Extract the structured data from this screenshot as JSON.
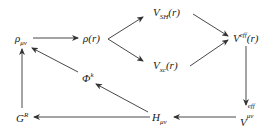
{
  "diagram": {
    "type": "flowchart-cycle",
    "nodes": {
      "rho_munu": {
        "base": "ρ",
        "sub": "μν",
        "sup": ""
      },
      "rho_r": {
        "base": "ρ(r)",
        "sub": "",
        "sup": ""
      },
      "v_sh": {
        "base": "V",
        "sub": "SH",
        "arg": "(r)"
      },
      "v_xc": {
        "base": "V",
        "sub": "xc",
        "arg": "(r)"
      },
      "v_eff_r": {
        "base": "V",
        "sup": "eff",
        "arg": "(r)"
      },
      "v_eff_munu": {
        "base": "V",
        "sup": "eff",
        "sub": "μν"
      },
      "h_munu": {
        "base": "H",
        "sub": "μν"
      },
      "g_r": {
        "base": "G",
        "sup": "R"
      },
      "phi_k": {
        "base": "Φ",
        "sup": "k"
      }
    },
    "edges": [
      {
        "from": "ρ_μν",
        "to": "ρ(r)"
      },
      {
        "from": "ρ(r)",
        "to": "V_SH(r)"
      },
      {
        "from": "ρ(r)",
        "to": "V_xc(r)"
      },
      {
        "from": "V_SH(r)",
        "to": "V^eff(r)"
      },
      {
        "from": "V_xc(r)",
        "to": "V^eff(r)"
      },
      {
        "from": "V^eff(r)",
        "to": "V^eff_μν"
      },
      {
        "from": "V^eff_μν",
        "to": "H_μν"
      },
      {
        "from": "H_μν",
        "to": "G^R"
      },
      {
        "from": "G^R",
        "to": "ρ_μν"
      },
      {
        "from": "H_μν",
        "to": "Φ^k"
      },
      {
        "from": "Φ^k",
        "to": "ρ_μν"
      }
    ],
    "colors": {
      "line": "#333333",
      "text": "#1a1a1a",
      "background": "#ffffff"
    }
  }
}
